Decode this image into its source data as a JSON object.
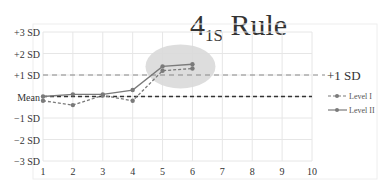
{
  "chart_data": {
    "type": "line",
    "title": "4",
    "title_subscript": "1S",
    "title_suffix": " Rule",
    "xlabel": "",
    "ylabel": "",
    "x": [
      1,
      2,
      3,
      4,
      5,
      6,
      7,
      8,
      9,
      10
    ],
    "x_tick_labels": [
      "1",
      "2",
      "3",
      "4",
      "5",
      "6",
      "7",
      "8",
      "9",
      "10"
    ],
    "y_tick_labels": [
      "+3 SD",
      "+2 SD",
      "+1 SD",
      "Mean",
      "−1 SD",
      "−2 SD",
      "−3 SD"
    ],
    "y_tick_values": [
      3,
      2,
      1,
      0,
      -1,
      -2,
      -3
    ],
    "ylim": [
      -3,
      3
    ],
    "xlim": [
      1,
      10
    ],
    "grid": true,
    "legend_position": "right",
    "series": [
      {
        "name": "Level I",
        "style": "dashed",
        "x": [
          1,
          2,
          3,
          4,
          5,
          6
        ],
        "values": [
          -0.2,
          -0.4,
          0.05,
          -0.2,
          1.2,
          1.3
        ]
      },
      {
        "name": "Level II",
        "style": "solid",
        "x": [
          1,
          2,
          3,
          4,
          5,
          6
        ],
        "values": [
          0.0,
          0.1,
          0.1,
          0.3,
          1.4,
          1.5
        ]
      }
    ],
    "reference_lines": [
      {
        "label": "+1 SD",
        "value": 1,
        "style": "dashed"
      },
      {
        "label": "Mean",
        "value": 0,
        "style": "dashed-bold"
      }
    ],
    "annotations": [
      {
        "type": "ellipse-highlight",
        "x_center": 5.6,
        "y_center": 1.4,
        "label": ""
      }
    ]
  },
  "colors": {
    "line": "#7a7a7a",
    "grid": "#e6e6e6",
    "highlight": "#d9d9d9",
    "text": "#333333"
  }
}
